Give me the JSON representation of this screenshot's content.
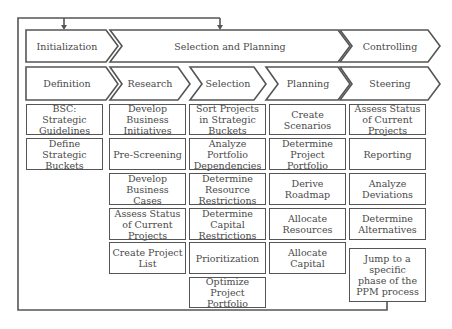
{
  "phases": [
    {
      "label": "Initialization"
    },
    {
      "label": "Selection and Planning"
    },
    {
      "label": "Controlling"
    }
  ],
  "subphases": [
    {
      "label": "Definition"
    },
    {
      "label": "Research"
    },
    {
      "label": "Selection"
    },
    {
      "label": "Planning"
    },
    {
      "label": "Steering"
    }
  ],
  "columns": [
    {
      "name": "definition",
      "tasks": [
        "BSC: Strategic Guidelines",
        "Define Strategic Buckets"
      ]
    },
    {
      "name": "research",
      "tasks": [
        "Develop Business Initiatives",
        "Pre-Screening",
        "Develop Business Cases",
        "Assess Status of Current Projects",
        "Create Project List"
      ]
    },
    {
      "name": "selection",
      "tasks": [
        "Sort Projects in Strategic Buckets",
        "Analyze Portfolio Dependencies",
        "Determine Resource Restrictions",
        "Determine Capital Restrictions",
        "Prioritization",
        "Optimize Project Portfolio"
      ]
    },
    {
      "name": "planning",
      "tasks": [
        "Create Scenarios",
        "Determine Project Portfolio",
        "Derive Roadmap",
        "Allocate Resources",
        "Allocate Capital"
      ]
    },
    {
      "name": "steering",
      "tasks": [
        "Assess Status of Current Projects",
        "Reporting",
        "Analyze Deviations",
        "Determine Alternatives"
      ]
    }
  ],
  "jump": {
    "label": "Jump to a specific phase of the PPM process"
  },
  "colors": {
    "stroke": "#555555",
    "text": "#4a4a4a",
    "background": "#ffffff"
  }
}
